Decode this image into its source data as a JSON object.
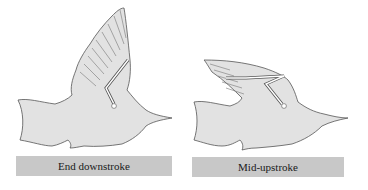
{
  "figure": {
    "panels": [
      {
        "id": "end-downstroke",
        "label": "End downstroke",
        "wing_position": "raised"
      },
      {
        "id": "mid-upstroke",
        "label": "Mid-upstroke",
        "wing_position": "folded-back"
      }
    ],
    "colors": {
      "bird_fill": "#e2e2e2",
      "bird_outline": "#555555",
      "label_bg": "#c8c8c8",
      "label_text": "#1a1a1a"
    }
  }
}
